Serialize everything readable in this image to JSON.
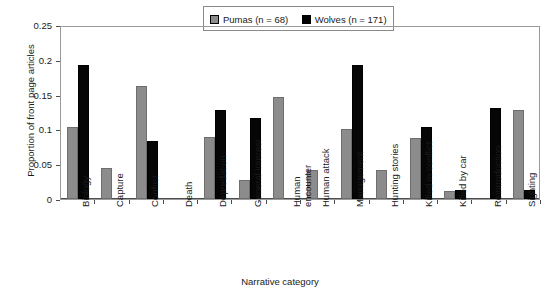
{
  "chart_data": {
    "type": "bar",
    "title": "",
    "xlabel": "Narrative category",
    "ylabel": "Proportion of front page articles",
    "ylim": [
      0,
      0.25
    ],
    "yticks": [
      "0",
      "0.05",
      "0.1",
      "0.15",
      "0.2",
      "0.25"
    ],
    "ytick_values": [
      0,
      0.05,
      0.1,
      0.15,
      0.2,
      0.25
    ],
    "grid": false,
    "legend_position": "top-center",
    "categories": [
      "Biology",
      "Capture",
      "Conflict",
      "Death",
      "Depredation",
      "General interest",
      "Human encounter",
      "Human attack",
      "Management",
      "Hunting stories",
      "Killed in conflict",
      "Killed by car",
      "Reintroduction",
      "Sighting"
    ],
    "series": [
      {
        "name": "Pumas (n = 68)",
        "color": "#8c8c8c",
        "values": [
          0.104,
          0.045,
          0.162,
          0,
          0.089,
          0.028,
          0.146,
          0.042,
          0.101,
          0.042,
          0.088,
          0.011,
          0,
          0.128
        ]
      },
      {
        "name": "Wolves (n = 171)",
        "color": "#000000",
        "values": [
          0.193,
          0,
          0.083,
          0,
          0.128,
          0.116,
          0,
          0,
          0.192,
          0,
          0.103,
          0.013,
          0.131,
          0.013
        ]
      }
    ]
  },
  "legend": {
    "entries": [
      {
        "label": "Pumas (n = 68)"
      },
      {
        "label": "Wolves (n = 171)"
      }
    ]
  }
}
